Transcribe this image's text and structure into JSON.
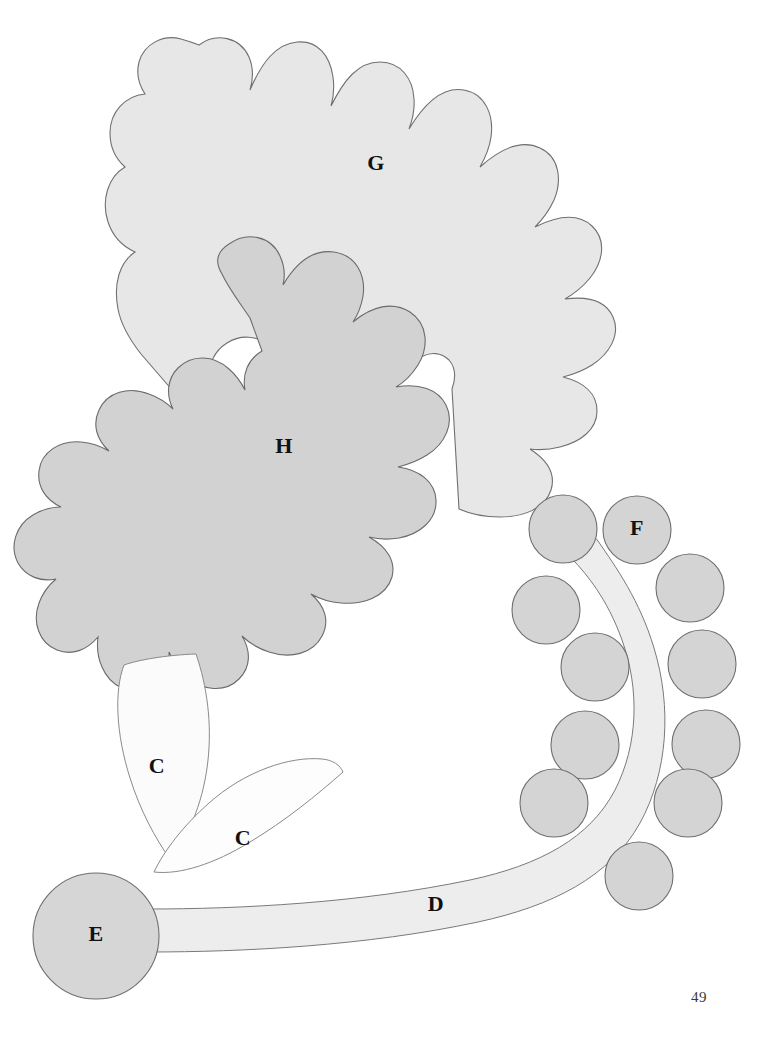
{
  "figure": {
    "page_number": "49",
    "background_color": "#ffffff",
    "outline_color": "#6e6e6e",
    "label_color": "#111111",
    "labels": [
      {
        "id": "G",
        "text": "G",
        "x": 376,
        "y": 165,
        "target": "upper-pale-lobed-blob"
      },
      {
        "id": "H",
        "text": "H",
        "x": 284,
        "y": 448,
        "target": "lower-dark-lobed-blob"
      },
      {
        "id": "F",
        "text": "F",
        "x": 637,
        "y": 530,
        "target": "labeled-circle"
      },
      {
        "id": "C-upper",
        "text": "C",
        "x": 157,
        "y": 768,
        "target": "upper-leaf"
      },
      {
        "id": "C-lower",
        "text": "C",
        "x": 243,
        "y": 840,
        "target": "lower-leaf"
      },
      {
        "id": "D",
        "text": "D",
        "x": 436,
        "y": 906,
        "target": "curved-stem-band"
      },
      {
        "id": "E",
        "text": "E",
        "x": 96,
        "y": 936,
        "target": "basal-circle"
      }
    ],
    "shapes": {
      "blob_g": {
        "name": "G",
        "fill": "#e7e7e7",
        "stroke": "#707070",
        "stroke_width": 1.1,
        "description": "large pale lobed cloud-like region, upper portion"
      },
      "blob_h": {
        "name": "H",
        "fill": "#d2d2d2",
        "stroke": "#6b6b6b",
        "stroke_width": 1.1,
        "description": "medium gray lobed cloud-like region, center-left, overlapping G"
      },
      "leaf_upper": {
        "name": "C",
        "fill": "#fbfbfb",
        "stroke": "#8a8a8a",
        "stroke_width": 1.0,
        "description": "narrow pointed lens/leaf shape rising up-right from base circle"
      },
      "leaf_lower": {
        "name": "C",
        "fill": "#fdfdfd",
        "stroke": "#8a8a8a",
        "stroke_width": 1.0,
        "description": "narrow pointed lens/leaf shape angled right from base circle"
      },
      "stem_band": {
        "name": "D",
        "fill": "#ededed",
        "stroke": "#7a7a7a",
        "stroke_width": 1.0,
        "description": "long tapering band running right from base circle then curving upward, rounded tip near F"
      },
      "circle_e": {
        "name": "E",
        "fill": "#d6d6d6",
        "stroke": "#6f6f6f",
        "stroke_width": 1.1,
        "cx": 96,
        "cy": 936,
        "r": 63,
        "description": "basal disc at lower left"
      },
      "circle_f_group": {
        "name": "F",
        "fill": "#d4d4d4",
        "stroke": "#6f6f6f",
        "stroke_width": 1.1,
        "description": "cluster of equal-sized discs flanking the curved stem"
      }
    },
    "circles": [
      {
        "id": "c1",
        "cx": 563,
        "cy": 529,
        "r": 34,
        "label": ""
      },
      {
        "id": "c2",
        "cx": 637,
        "cy": 530,
        "r": 34,
        "label": "F"
      },
      {
        "id": "c3",
        "cx": 546,
        "cy": 610,
        "r": 34,
        "label": ""
      },
      {
        "id": "c4",
        "cx": 690,
        "cy": 588,
        "r": 34,
        "label": ""
      },
      {
        "id": "c5",
        "cx": 595,
        "cy": 667,
        "r": 34,
        "label": ""
      },
      {
        "id": "c6",
        "cx": 702,
        "cy": 664,
        "r": 34,
        "label": ""
      },
      {
        "id": "c7",
        "cx": 585,
        "cy": 745,
        "r": 34,
        "label": ""
      },
      {
        "id": "c8",
        "cx": 706,
        "cy": 744,
        "r": 34,
        "label": ""
      },
      {
        "id": "c9",
        "cx": 554,
        "cy": 803,
        "r": 34,
        "label": ""
      },
      {
        "id": "c10",
        "cx": 688,
        "cy": 803,
        "r": 34,
        "label": ""
      },
      {
        "id": "c11",
        "cx": 639,
        "cy": 876,
        "r": 34,
        "label": ""
      }
    ]
  }
}
